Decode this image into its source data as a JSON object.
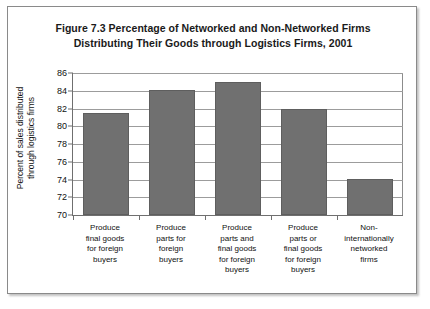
{
  "figure": {
    "title_line1": "Figure 7.3 Percentage of Networked and Non-Networked Firms",
    "title_line2": "Distributing Their Goods through Logistics Firms, 2001",
    "bar_color": "#707070",
    "frame_color": "#8a8a8a",
    "gridline_color": "#9c9c9c"
  },
  "axis": {
    "y_title_line1": "Percent of sales distributed",
    "y_title_line2": "through logistics firms",
    "y_ticks": [
      "86",
      "84",
      "82",
      "80",
      "78",
      "76",
      "74",
      "72",
      "70"
    ]
  },
  "chart_data": {
    "type": "bar",
    "title": "Figure 7.3 Percentage of Networked and Non-Networked Firms Distributing Their Goods through Logistics Firms, 2001",
    "xlabel": "",
    "ylabel": "Percent of sales distributed through logistics firms",
    "ylim": [
      70,
      86
    ],
    "ytick_step": 2,
    "grid": true,
    "legend": false,
    "categories": [
      "Produce final goods for foreign buyers",
      "Produce parts for foreign buyers",
      "Produce parts and final goods for foreign buyers",
      "Produce parts or final goods for foreign buyers",
      "Non-internationally networked firms"
    ],
    "category_lines": [
      [
        "Produce",
        "final goods",
        "for foreign",
        "buyers"
      ],
      [
        "Produce",
        "parts for",
        "foreign",
        "buyers"
      ],
      [
        "Produce",
        "parts and",
        "final goods",
        "for foreign",
        "buyers"
      ],
      [
        "Produce",
        "parts or",
        "final goods",
        "for foreign",
        "buyers"
      ],
      [
        "Non-",
        "internationally",
        "networked",
        "firms"
      ]
    ],
    "values": [
      81.5,
      84.1,
      85.0,
      82.0,
      74.1
    ]
  }
}
